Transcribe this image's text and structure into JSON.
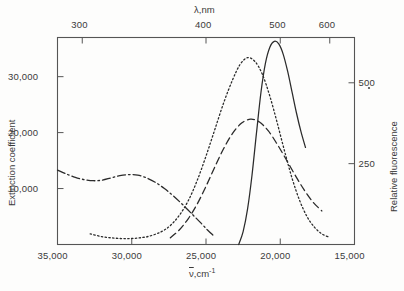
{
  "figure": {
    "background_color": "#fdfdfc",
    "ink_color": "#2b2b2b"
  },
  "axes": {
    "top": {
      "title": "λ,nm",
      "unit": "nm",
      "name": "wavelength-axis",
      "ticks": [
        {
          "label": "300",
          "nm": 300
        },
        {
          "label": "400",
          "nm": 400
        },
        {
          "label": "500",
          "nm": 500
        },
        {
          "label": "600",
          "nm": 600
        }
      ]
    },
    "bottom": {
      "title_prefix": "ν",
      "title_suffix": ",cm",
      "title_exponent": "-1",
      "title_plain": "ν̅,cm⁻¹",
      "name": "wavenumber-axis",
      "ticks": [
        {
          "label": "35,000",
          "value": 35000
        },
        {
          "label": "30,000",
          "value": 30000
        },
        {
          "label": "25,000",
          "value": 25000
        },
        {
          "label": "20,000",
          "value": 20000
        },
        {
          "label": "15,000",
          "value": 15000
        }
      ]
    },
    "left": {
      "title": "Extinction coefficient",
      "name": "extinction-coefficient-axis",
      "ticks": [
        {
          "label": "10,000",
          "value": 10000
        },
        {
          "label": "20,000",
          "value": 20000
        },
        {
          "label": "30,000",
          "value": 30000
        }
      ]
    },
    "right": {
      "title": "Relative fluorescence",
      "name": "relative-fluorescence-axis",
      "ticks": [
        {
          "label": "250",
          "value": 250
        },
        {
          "label": "500",
          "value": 500
        }
      ]
    }
  },
  "chart_data": {
    "type": "line",
    "title": "",
    "subtitle": "",
    "xlabel": "ν̅,cm⁻¹",
    "ylabel": "Extinction coefficient",
    "y2label": "Relative fluorescence",
    "x2label": "λ,nm",
    "xlim": [
      35000,
      15000
    ],
    "xlim_reversed": true,
    "ylim": [
      0,
      37000
    ],
    "y2lim": [
      0,
      640
    ],
    "x2lim_nm": [
      285,
      667
    ],
    "grid": false,
    "legend": false,
    "legend_position": "none",
    "annotations": [],
    "series": [
      {
        "name": "absorption-dash-dot",
        "style": "dash-dot",
        "axis": "left",
        "units": "extinction coefficient vs cm^-1",
        "points_cm1": [
          [
            35000,
            13300
          ],
          [
            34400,
            12600
          ],
          [
            33800,
            12000
          ],
          [
            33200,
            11600
          ],
          [
            32600,
            11400
          ],
          [
            32000,
            11500
          ],
          [
            31400,
            11900
          ],
          [
            30800,
            12300
          ],
          [
            30200,
            12500
          ],
          [
            29600,
            12400
          ],
          [
            29000,
            11900
          ],
          [
            28400,
            11100
          ],
          [
            27800,
            10000
          ],
          [
            27200,
            8700
          ],
          [
            26600,
            7200
          ],
          [
            26000,
            5600
          ],
          [
            25400,
            4000
          ],
          [
            24900,
            2600
          ],
          [
            24500,
            1600
          ]
        ]
      },
      {
        "name": "absorption-dashed",
        "style": "dashed",
        "axis": "left",
        "units": "extinction coefficient vs cm^-1",
        "points_cm1": [
          [
            27400,
            1200
          ],
          [
            26800,
            2600
          ],
          [
            26200,
            4600
          ],
          [
            25600,
            7200
          ],
          [
            25000,
            10400
          ],
          [
            24400,
            13900
          ],
          [
            23800,
            17200
          ],
          [
            23200,
            19900
          ],
          [
            22600,
            21700
          ],
          [
            22000,
            22400
          ],
          [
            21400,
            21900
          ],
          [
            20800,
            20300
          ],
          [
            20200,
            17900
          ],
          [
            19600,
            15200
          ],
          [
            19000,
            12400
          ],
          [
            18400,
            9800
          ],
          [
            17800,
            7600
          ],
          [
            17200,
            6000
          ]
        ]
      },
      {
        "name": "absorption-dotted",
        "style": "dotted",
        "axis": "left",
        "units": "extinction coefficient vs cm^-1",
        "points_cm1": [
          [
            32800,
            1900
          ],
          [
            32000,
            1400
          ],
          [
            31200,
            1150
          ],
          [
            30400,
            1050
          ],
          [
            29600,
            1150
          ],
          [
            28800,
            1500
          ],
          [
            28000,
            2300
          ],
          [
            27400,
            3400
          ],
          [
            26800,
            5200
          ],
          [
            26200,
            7800
          ],
          [
            25600,
            11400
          ],
          [
            25000,
            15800
          ],
          [
            24400,
            20600
          ],
          [
            23800,
            25400
          ],
          [
            23200,
            29500
          ],
          [
            22700,
            32200
          ],
          [
            22200,
            33400
          ],
          [
            21700,
            32700
          ],
          [
            21200,
            30400
          ],
          [
            20700,
            26500
          ],
          [
            20200,
            21700
          ],
          [
            19700,
            16600
          ],
          [
            19200,
            11800
          ],
          [
            18700,
            7900
          ],
          [
            18200,
            5000
          ],
          [
            17700,
            3100
          ],
          [
            17200,
            1900
          ],
          [
            16700,
            1300
          ]
        ]
      },
      {
        "name": "fluorescence-solid",
        "style": "solid",
        "axis": "right",
        "units": "relative fluorescence vs cm^-1",
        "points_cm1": [
          [
            22800,
            0
          ],
          [
            22500,
            40
          ],
          [
            22200,
            110
          ],
          [
            21900,
            215
          ],
          [
            21600,
            345
          ],
          [
            21300,
            470
          ],
          [
            21000,
            560
          ],
          [
            20700,
            610
          ],
          [
            20400,
            628
          ],
          [
            20100,
            620
          ],
          [
            19800,
            588
          ],
          [
            19500,
            535
          ],
          [
            19200,
            470
          ],
          [
            18900,
            405
          ],
          [
            18600,
            348
          ],
          [
            18300,
            300
          ]
        ]
      }
    ]
  }
}
